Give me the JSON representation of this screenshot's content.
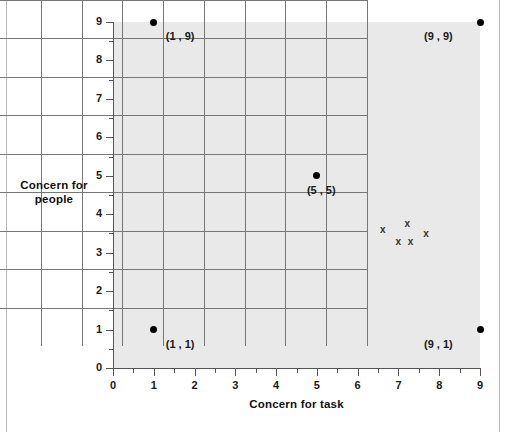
{
  "chart_data": {
    "type": "scatter",
    "title": "",
    "xlabel": "Concern for task",
    "ylabel": "Concern for people",
    "xlim": [
      0,
      9
    ],
    "ylim": [
      0,
      9
    ],
    "grid": true,
    "legend": "none",
    "x_ticks": [
      "0",
      "1",
      "2",
      "3",
      "4",
      "5",
      "6",
      "7",
      "8",
      "9"
    ],
    "y_ticks": [
      "0",
      "1",
      "2",
      "3",
      "4",
      "5",
      "6",
      "7",
      "8",
      "9"
    ],
    "x_minor_ticks": [
      0.5,
      1.5,
      2.5,
      3.5,
      4.5,
      5.5,
      6.5,
      7.5,
      8.5
    ],
    "y_minor_ticks": [
      0.5,
      1.5,
      2.5,
      3.5,
      4.5,
      5.5,
      6.5,
      7.5,
      8.5
    ],
    "series": [
      {
        "name": "corner-styles",
        "marker": "filled-circle",
        "color": "#000000",
        "points": [
          {
            "x": 1,
            "y": 9,
            "label": "(1 , 9)",
            "label_dx": 12,
            "label_dy": 8
          },
          {
            "x": 9,
            "y": 9,
            "label": "(9 , 9)",
            "label_dx": -56,
            "label_dy": 8
          },
          {
            "x": 5,
            "y": 5,
            "label": "(5 , 5)",
            "label_dx": -10,
            "label_dy": 8
          },
          {
            "x": 1,
            "y": 1,
            "label": "(1 , 1)",
            "label_dx": 12,
            "label_dy": 8
          },
          {
            "x": 9,
            "y": 1,
            "label": "(9 , 1)",
            "label_dx": -56,
            "label_dy": 8
          }
        ]
      },
      {
        "name": "respondent-cluster",
        "marker": "x",
        "marker_glyph": "x",
        "color": "#333333",
        "points": [
          {
            "x": 6.62,
            "y": 3.58
          },
          {
            "x": 7.22,
            "y": 3.75
          },
          {
            "x": 7.68,
            "y": 3.48
          },
          {
            "x": 7.0,
            "y": 3.28
          },
          {
            "x": 7.3,
            "y": 3.28
          }
        ]
      }
    ]
  },
  "axes": {
    "x_title": "Concern for task",
    "y_title_line1": "Concern for",
    "y_title_line2": "people"
  },
  "colors": {
    "plot_background": "#e9e9e9",
    "gridline": "#777777",
    "axis": "#555555",
    "point": "#000000",
    "marker": "#333333",
    "text": "#1a1a1a",
    "page_background": "#ffffff",
    "frame_border": "#b8b8b8"
  }
}
